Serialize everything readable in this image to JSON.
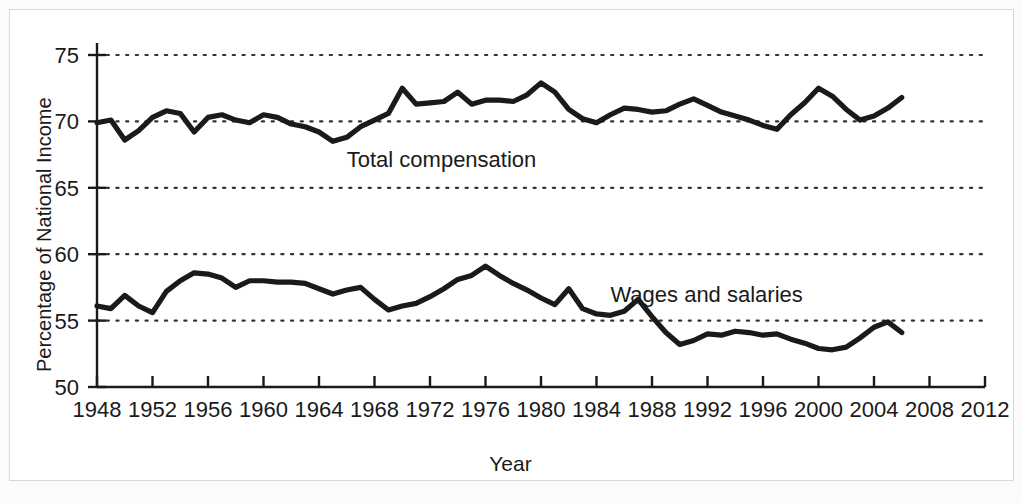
{
  "figure": {
    "background_color": "#fbfbfb",
    "paper_color": "#ffffff",
    "border_color": "#d8d8d8",
    "line_color": "#1a1a1a",
    "grid_color": "#333333"
  },
  "chart_data": {
    "type": "line",
    "title": "",
    "xlabel": "Year",
    "ylabel": "Percentage of National Income",
    "xlim": [
      1948,
      2012
    ],
    "ylim": [
      50,
      75
    ],
    "xticks": [
      1948,
      1952,
      1956,
      1960,
      1964,
      1968,
      1972,
      1976,
      1980,
      1984,
      1988,
      1992,
      1996,
      2000,
      2004,
      2008,
      2012
    ],
    "xticklabels": [
      "1948",
      "1952",
      "1956",
      "1960",
      "1964",
      "1968",
      "1972",
      "1976",
      "1980",
      "1984",
      "1988",
      "1992",
      "1996",
      "2000",
      "2004",
      "2008",
      "2012"
    ],
    "yticks": [
      50,
      55,
      60,
      65,
      70,
      75
    ],
    "yticklabels": [
      "50",
      "55",
      "60",
      "65",
      "70",
      "75"
    ],
    "grid": "horizontal-dotted",
    "legend": "inline-annotations",
    "x": [
      1948,
      1949,
      1950,
      1951,
      1952,
      1953,
      1954,
      1955,
      1956,
      1957,
      1958,
      1959,
      1960,
      1961,
      1962,
      1963,
      1964,
      1965,
      1966,
      1967,
      1968,
      1969,
      1970,
      1971,
      1972,
      1973,
      1974,
      1975,
      1976,
      1977,
      1978,
      1979,
      1980,
      1981,
      1982,
      1983,
      1984,
      1985,
      1986,
      1987,
      1988,
      1989,
      1990,
      1991,
      1992,
      1993,
      1994,
      1995,
      1996,
      1997,
      1998,
      1999,
      2000,
      2001,
      2002,
      2003,
      2004,
      2005,
      2006
    ],
    "series": [
      {
        "name": "Total compensation",
        "annotation": "Total compensation",
        "annotation_x": 1966,
        "annotation_y": 66.6,
        "values": [
          69.9,
          70.1,
          68.6,
          69.3,
          70.3,
          70.8,
          70.6,
          69.2,
          70.3,
          70.5,
          70.1,
          69.9,
          70.5,
          70.3,
          69.8,
          69.6,
          69.2,
          68.5,
          68.8,
          69.6,
          70.1,
          70.6,
          72.5,
          71.3,
          71.4,
          71.5,
          72.2,
          71.3,
          71.6,
          71.6,
          71.5,
          72.0,
          72.9,
          72.2,
          70.9,
          70.2,
          69.9,
          70.5,
          71.0,
          70.9,
          70.7,
          70.8,
          71.3,
          71.7,
          71.2,
          70.7,
          70.4,
          70.1,
          69.7,
          69.4,
          70.5,
          71.4,
          72.5,
          71.9,
          70.9,
          70.1,
          70.4,
          71.0,
          71.8
        ]
      },
      {
        "name": "Wages and salaries",
        "annotation": "Wages and salaries",
        "annotation_x": 1985,
        "annotation_y": 56.4,
        "values": [
          56.1,
          55.9,
          56.9,
          56.1,
          55.6,
          57.2,
          58.0,
          58.6,
          58.5,
          58.2,
          57.5,
          58.0,
          58.0,
          57.9,
          57.9,
          57.8,
          57.4,
          57.0,
          57.3,
          57.5,
          56.6,
          55.8,
          56.1,
          56.3,
          56.8,
          57.4,
          58.1,
          58.4,
          59.1,
          58.4,
          57.8,
          57.3,
          56.7,
          56.2,
          57.4,
          55.9,
          55.5,
          55.4,
          55.7,
          56.6,
          55.3,
          54.1,
          53.2,
          53.5,
          54.0,
          53.9,
          54.2,
          54.1,
          53.9,
          54.0,
          53.6,
          53.3,
          52.9,
          52.8,
          53.0,
          53.7,
          54.5,
          54.9,
          54.1
        ]
      }
    ]
  }
}
